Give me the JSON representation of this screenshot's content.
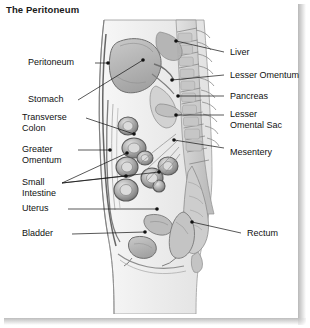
{
  "figure": {
    "title": "The Peritoneum",
    "view": "midsagittal",
    "colors": {
      "background": "#ffffff",
      "panel": "#ffffff",
      "ink": "#111111",
      "leader_line": "#111111",
      "shadow": "#bdbdbd",
      "organ_fill": "#b9b9b9",
      "organ_fill_light": "#d8d8d8",
      "body_fill": "#efefef",
      "bone_fill": "#cfcfcf"
    }
  },
  "labels_left": [
    {
      "id": "peritoneum",
      "text": "Peritoneum",
      "text2": "",
      "x": 28,
      "y": 58,
      "line_x": 95,
      "line_y": 63,
      "dot_x": 108,
      "dot_y": 63
    },
    {
      "id": "stomach",
      "text": "Stomach",
      "text2": "",
      "x": 28,
      "y": 95,
      "line_x": 78,
      "line_y": 100,
      "dot_x": 143,
      "dot_y": 60
    },
    {
      "id": "transverse-colon",
      "text": "Transverse",
      "text2": "Colon",
      "x": 22,
      "y": 113,
      "line_x": 86,
      "line_y": 118,
      "dot_x": 134,
      "dot_y": 134
    },
    {
      "id": "greater-omentum",
      "text": "Greater",
      "text2": "Omentum",
      "x": 22,
      "y": 145,
      "line_x": 78,
      "line_y": 150,
      "dot_x": 110,
      "dot_y": 150
    },
    {
      "id": "small-intestine",
      "text": "Small",
      "text2": "Intestine",
      "x": 22,
      "y": 178,
      "line_x": 62,
      "line_y": 183,
      "dot_x": 159,
      "dot_y": 172
    },
    {
      "id": "uterus",
      "text": "Uterus",
      "text2": "",
      "x": 22,
      "y": 204,
      "line_x": 68,
      "line_y": 209,
      "dot_x": 157,
      "dot_y": 209
    },
    {
      "id": "bladder",
      "text": "Bladder",
      "text2": "",
      "x": 22,
      "y": 229,
      "line_x": 72,
      "line_y": 234,
      "dot_x": 145,
      "dot_y": 232
    }
  ],
  "labels_right": [
    {
      "id": "liver",
      "text": "Liver",
      "text2": "",
      "x": 228,
      "y": 48,
      "line_x": 220,
      "line_y": 52,
      "dot_x": 176,
      "dot_y": 41
    },
    {
      "id": "lesser-omentum",
      "text": "Lesser Omentum",
      "text2": "",
      "x": 228,
      "y": 71,
      "line_x": 220,
      "line_y": 75,
      "dot_x": 172,
      "dot_y": 80
    },
    {
      "id": "pancreas",
      "text": "Pancreas",
      "text2": "",
      "x": 228,
      "y": 92,
      "line_x": 220,
      "line_y": 96,
      "dot_x": 178,
      "dot_y": 96
    },
    {
      "id": "lesser-omental-sac",
      "text": "Lesser",
      "text2": "Omental Sac",
      "x": 228,
      "y": 110,
      "line_x": 220,
      "line_y": 115,
      "dot_x": 176,
      "dot_y": 115
    },
    {
      "id": "mesentery",
      "text": "Mesentery",
      "text2": "",
      "x": 228,
      "y": 148,
      "line_x": 220,
      "line_y": 152,
      "dot_x": 174,
      "dot_y": 140
    },
    {
      "id": "rectum",
      "text": "Rectum",
      "text2": "",
      "x": 245,
      "y": 229,
      "line_x": 238,
      "line_y": 233,
      "dot_x": 192,
      "dot_y": 222
    }
  ],
  "structures": [
    "peritoneum",
    "stomach",
    "transverse colon",
    "greater omentum",
    "small intestine",
    "uterus",
    "bladder",
    "liver",
    "lesser omentum",
    "pancreas",
    "lesser omental sac",
    "mesentery",
    "rectum",
    "vertebral column",
    "sacrum",
    "anterior abdominal wall"
  ]
}
